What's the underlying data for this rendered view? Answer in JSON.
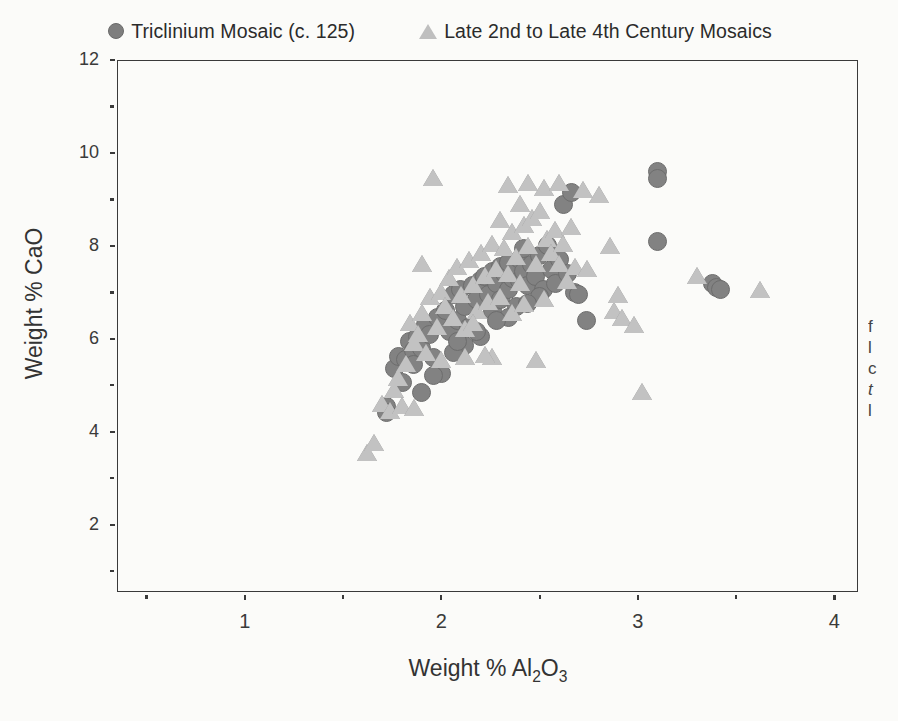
{
  "legend": {
    "position": "top-center",
    "entries": [
      {
        "label": "Triclinium Mosaic (c. 125)",
        "marker": "filled-circle",
        "color": "#7e7e7e"
      },
      {
        "label": "Late 2nd to Late 4th Century Mosaics",
        "marker": "filled-triangle",
        "color": "#bfbfbf"
      }
    ]
  },
  "axes": {
    "xlabel_prefix": "Weight % Al",
    "xlabel_sub1": "2",
    "xlabel_mid": "O",
    "xlabel_sub2": "3",
    "ylabel": "Weight % CaO",
    "x_ticks": [
      "1",
      "2",
      "3",
      "4"
    ],
    "y_ticks": [
      "12",
      "10",
      "8",
      "6",
      "4",
      "2"
    ]
  },
  "edge_caption": {
    "lines": [
      "f",
      "l",
      "c",
      "t",
      "l"
    ]
  },
  "chart_data": {
    "type": "scatter",
    "title": "",
    "xlabel": "Weight % Al2O3",
    "ylabel": "Weight % CaO",
    "xlim": [
      0.35,
      4.12
    ],
    "ylim": [
      0.55,
      12.0
    ],
    "xticks": [
      1,
      2,
      3,
      4
    ],
    "xminor": [
      0.5,
      1.5,
      2.5,
      3.5
    ],
    "yticks": [
      2,
      4,
      6,
      8,
      10,
      12
    ],
    "yminor": [
      1,
      3,
      5,
      7,
      9,
      11
    ],
    "grid": false,
    "legend_position": "above-axes",
    "series": [
      {
        "name": "Triclinium Mosaic (c. 125)",
        "marker": "circle",
        "color": "#828282",
        "points": [
          [
            1.72,
            4.55
          ],
          [
            1.72,
            4.42
          ],
          [
            1.76,
            5.35
          ],
          [
            1.78,
            5.62
          ],
          [
            1.8,
            5.05
          ],
          [
            1.82,
            5.55
          ],
          [
            1.84,
            5.95
          ],
          [
            1.86,
            5.75
          ],
          [
            1.86,
            5.45
          ],
          [
            1.88,
            6.05
          ],
          [
            1.9,
            5.8
          ],
          [
            1.9,
            4.85
          ],
          [
            1.92,
            6.3
          ],
          [
            1.94,
            6.1
          ],
          [
            1.96,
            5.6
          ],
          [
            1.98,
            6.45
          ],
          [
            2.0,
            5.25
          ],
          [
            2.02,
            6.6
          ],
          [
            2.04,
            6.15
          ],
          [
            2.06,
            6.95
          ],
          [
            2.08,
            6.4
          ],
          [
            2.1,
            7.05
          ],
          [
            2.12,
            6.7
          ],
          [
            2.14,
            6.25
          ],
          [
            2.16,
            7.15
          ],
          [
            2.18,
            6.85
          ],
          [
            2.2,
            7.25
          ],
          [
            2.2,
            6.05
          ],
          [
            2.22,
            7.35
          ],
          [
            2.24,
            6.95
          ],
          [
            2.26,
            7.45
          ],
          [
            2.26,
            6.6
          ],
          [
            2.28,
            7.2
          ],
          [
            2.3,
            7.55
          ],
          [
            2.3,
            6.85
          ],
          [
            2.32,
            7.4
          ],
          [
            2.34,
            7.65
          ],
          [
            2.34,
            7.05
          ],
          [
            2.36,
            7.3
          ],
          [
            2.38,
            7.5
          ],
          [
            2.38,
            6.7
          ],
          [
            2.4,
            7.7
          ],
          [
            2.4,
            7.25
          ],
          [
            2.42,
            7.95
          ],
          [
            2.42,
            7.45
          ],
          [
            2.44,
            7.15
          ],
          [
            2.46,
            7.6
          ],
          [
            2.48,
            7.35
          ],
          [
            2.5,
            7.8
          ],
          [
            2.52,
            7.05
          ],
          [
            2.54,
            8.0
          ],
          [
            2.56,
            7.5
          ],
          [
            2.58,
            7.2
          ],
          [
            2.6,
            7.7
          ],
          [
            2.62,
            8.9
          ],
          [
            2.64,
            7.4
          ],
          [
            2.66,
            9.15
          ],
          [
            2.68,
            7.0
          ],
          [
            2.7,
            6.95
          ],
          [
            2.74,
            6.4
          ],
          [
            3.1,
            9.6
          ],
          [
            3.1,
            9.45
          ],
          [
            3.1,
            8.1
          ],
          [
            3.38,
            7.2
          ],
          [
            3.4,
            7.1
          ],
          [
            3.42,
            7.05
          ],
          [
            2.12,
            5.85
          ],
          [
            2.06,
            5.7
          ],
          [
            1.96,
            5.2
          ],
          [
            2.34,
            6.45
          ],
          [
            2.5,
            6.9
          ],
          [
            2.44,
            6.75
          ],
          [
            2.28,
            6.4
          ],
          [
            2.18,
            6.15
          ],
          [
            2.08,
            5.95
          ]
        ]
      },
      {
        "name": "Late 2nd to Late 4th Century Mosaics",
        "marker": "triangle",
        "color": "#c2c2c2",
        "points": [
          [
            1.62,
            3.55
          ],
          [
            1.66,
            3.75
          ],
          [
            1.7,
            4.6
          ],
          [
            1.74,
            4.45
          ],
          [
            1.76,
            4.9
          ],
          [
            1.78,
            5.15
          ],
          [
            1.8,
            4.55
          ],
          [
            1.82,
            5.45
          ],
          [
            1.84,
            6.35
          ],
          [
            1.86,
            5.9
          ],
          [
            1.86,
            4.5
          ],
          [
            1.88,
            6.1
          ],
          [
            1.9,
            7.6
          ],
          [
            1.9,
            6.55
          ],
          [
            1.92,
            5.7
          ],
          [
            1.94,
            6.9
          ],
          [
            1.96,
            9.45
          ],
          [
            1.98,
            6.25
          ],
          [
            2.0,
            7.0
          ],
          [
            2.0,
            5.55
          ],
          [
            2.02,
            6.7
          ],
          [
            2.04,
            7.3
          ],
          [
            2.06,
            6.45
          ],
          [
            2.08,
            7.55
          ],
          [
            2.1,
            6.95
          ],
          [
            2.12,
            6.2
          ],
          [
            2.14,
            7.7
          ],
          [
            2.16,
            7.15
          ],
          [
            2.18,
            6.6
          ],
          [
            2.2,
            7.85
          ],
          [
            2.22,
            7.35
          ],
          [
            2.24,
            6.8
          ],
          [
            2.26,
            8.05
          ],
          [
            2.26,
            5.6
          ],
          [
            2.28,
            7.5
          ],
          [
            2.3,
            8.55
          ],
          [
            2.3,
            6.9
          ],
          [
            2.32,
            7.95
          ],
          [
            2.34,
            9.3
          ],
          [
            2.34,
            7.4
          ],
          [
            2.36,
            8.3
          ],
          [
            2.38,
            7.75
          ],
          [
            2.4,
            8.9
          ],
          [
            2.4,
            7.2
          ],
          [
            2.42,
            8.45
          ],
          [
            2.44,
            9.35
          ],
          [
            2.44,
            8.0
          ],
          [
            2.46,
            8.6
          ],
          [
            2.48,
            7.6
          ],
          [
            2.48,
            5.55
          ],
          [
            2.5,
            8.75
          ],
          [
            2.52,
            9.25
          ],
          [
            2.54,
            8.15
          ],
          [
            2.56,
            7.85
          ],
          [
            2.58,
            8.35
          ],
          [
            2.6,
            9.35
          ],
          [
            2.6,
            7.6
          ],
          [
            2.62,
            8.05
          ],
          [
            2.64,
            7.25
          ],
          [
            2.66,
            8.4
          ],
          [
            2.68,
            7.55
          ],
          [
            2.72,
            9.2
          ],
          [
            2.74,
            7.5
          ],
          [
            2.8,
            9.1
          ],
          [
            2.86,
            8.0
          ],
          [
            2.88,
            6.6
          ],
          [
            2.9,
            6.95
          ],
          [
            2.92,
            6.45
          ],
          [
            2.98,
            6.3
          ],
          [
            3.02,
            4.85
          ],
          [
            3.3,
            7.35
          ],
          [
            3.62,
            7.05
          ],
          [
            2.12,
            5.6
          ],
          [
            2.22,
            5.65
          ],
          [
            2.16,
            6.35
          ],
          [
            2.36,
            6.55
          ],
          [
            2.42,
            6.75
          ],
          [
            2.52,
            6.85
          ]
        ]
      }
    ]
  }
}
